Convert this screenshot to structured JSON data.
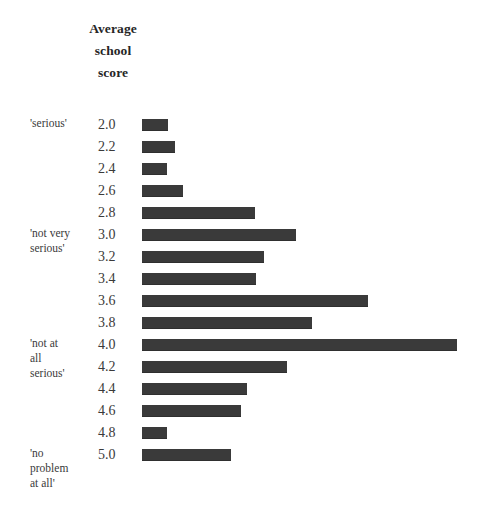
{
  "header": {
    "lines": [
      "Average",
      "school",
      "score"
    ]
  },
  "chart_data": {
    "type": "bar",
    "orientation": "horizontal",
    "title": "Average school score",
    "xlabel": "",
    "ylabel": "Average school score",
    "grid": false,
    "legend": null,
    "categories": [
      "2.0",
      "2.2",
      "2.4",
      "2.6",
      "2.8",
      "3.0",
      "3.2",
      "3.4",
      "3.6",
      "3.8",
      "4.0",
      "4.2",
      "4.4",
      "4.6",
      "4.8",
      "5.0"
    ],
    "values": [
      26,
      33,
      25,
      41,
      113,
      154,
      122,
      114,
      226,
      170,
      315,
      145,
      105,
      99,
      25,
      89
    ],
    "value_unit": "px bar length (unlabelled frequency axis)",
    "xlim": [
      0,
      330
    ],
    "bar_color": "#3a3a3a",
    "category_labels": [
      {
        "score": "2.0",
        "text": "'serious'"
      },
      {
        "score": "3.0",
        "text": "'not very\nserious'"
      },
      {
        "score": "4.0",
        "text": "'not at\nall\nserious'"
      },
      {
        "score": "5.0",
        "text": "'no\nproblem\nat all'"
      }
    ]
  }
}
